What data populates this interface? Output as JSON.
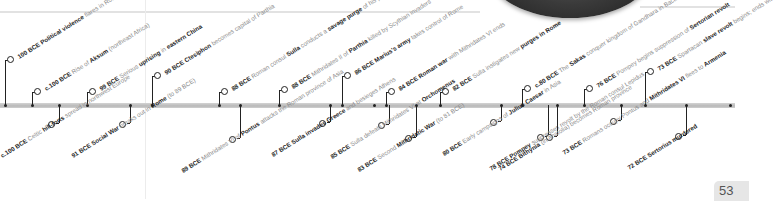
{
  "page": {
    "page_number": "53"
  },
  "timeline": {
    "above": [
      {
        "date": "100 BCE",
        "parts": [
          {
            "t": "Political violence",
            "b": true
          },
          {
            "t": " flares in Rome",
            "b": false
          }
        ],
        "x": 5,
        "ringY": 56
      },
      {
        "date": "c.100 BCE",
        "parts": [
          {
            "t": "Rise of ",
            "b": false
          },
          {
            "t": "Aksum",
            "b": true
          },
          {
            "t": " (northeast Africa)",
            "b": false
          }
        ],
        "x": 32,
        "ringY": 88
      },
      {
        "date": "99 BCE",
        "parts": [
          {
            "t": "Serious ",
            "b": false
          },
          {
            "t": "uprising",
            "b": true
          },
          {
            "t": " in ",
            "b": false
          },
          {
            "t": "eastern China",
            "b": true
          }
        ],
        "x": 87,
        "ringY": 88
      },
      {
        "date": "90 BCE",
        "parts": [
          {
            "t": "Ctesiphon",
            "b": true
          },
          {
            "t": " becomes capital of Parthia",
            "b": false
          }
        ],
        "x": 152,
        "ringY": 72
      },
      {
        "date": "88 BCE",
        "parts": [
          {
            "t": "Roman consul ",
            "b": false
          },
          {
            "t": "Sulla",
            "b": true
          },
          {
            "t": " conducts a ",
            "b": false
          },
          {
            "t": "savage purge",
            "b": true
          },
          {
            "t": " of his pro-Marian opponents",
            "b": false
          }
        ],
        "x": 219,
        "ringY": 88
      },
      {
        "date": "88 BCE",
        "parts": [
          {
            "t": "Mithridates II of ",
            "b": false
          },
          {
            "t": "Parthia",
            "b": true
          },
          {
            "t": " killed by Scythian invaders",
            "b": false
          }
        ],
        "x": 279,
        "ringY": 86
      },
      {
        "date": "86 BCE",
        "parts": [
          {
            "t": "Marius's army",
            "b": true
          },
          {
            "t": " takes control of Rome",
            "b": false
          }
        ],
        "x": 342,
        "ringY": 72
      },
      {
        "date": "84 BCE",
        "parts": [
          {
            "t": "Roman war",
            "b": true
          },
          {
            "t": " with Mithridates VI ends",
            "b": false
          }
        ],
        "x": 386,
        "ringY": 88
      },
      {
        "date": "82 BCE",
        "parts": [
          {
            "t": "Sulla instigates new ",
            "b": false
          },
          {
            "t": "purges in Rome",
            "b": true
          }
        ],
        "x": 440,
        "ringY": 88
      },
      {
        "date": "c.80 BCE",
        "parts": [
          {
            "t": "The ",
            "b": false
          },
          {
            "t": "Sakas",
            "b": true
          },
          {
            "t": " conquer kingdom of Gandhara in Bactria",
            "b": false
          }
        ],
        "x": 522,
        "ringY": 85
      },
      {
        "date": "76 BCE",
        "parts": [
          {
            "t": "Pompey begins suppression of ",
            "b": false
          },
          {
            "t": "Sertorian revolt",
            "b": true
          }
        ],
        "x": 584,
        "ringY": 85
      },
      {
        "date": "73 BCE",
        "parts": [
          {
            "t": "Spartacan ",
            "b": false
          },
          {
            "t": "slave revolt",
            "b": true
          },
          {
            "t": " begins; ends with defeat by Crassus in 71 BCE",
            "b": false
          }
        ],
        "x": 645,
        "ringY": 68
      }
    ],
    "below": [
      {
        "date": "c.100 BCE",
        "parts": [
          {
            "t": "Celtic ",
            "b": false
          },
          {
            "t": "hill-forts",
            "b": true
          },
          {
            "t": " spread in northwest Europe",
            "b": false
          }
        ],
        "x": 59,
        "ringY": 123
      },
      {
        "date": "91 BCE",
        "parts": [
          {
            "t": "Social War",
            "b": true
          },
          {
            "t": " breaks out in ",
            "b": false
          },
          {
            "t": "Rome",
            "b": true
          },
          {
            "t": " (to 89 BCE)",
            "b": false
          }
        ],
        "x": 130,
        "ringY": 123
      },
      {
        "date": "89 BCE",
        "parts": [
          {
            "t": "Mithridates VI of ",
            "b": false
          },
          {
            "t": "Pontus",
            "b": true
          },
          {
            "t": " attacks the Roman province of Asia",
            "b": false
          }
        ],
        "x": 240,
        "ringY": 138
      },
      {
        "date": "87 BCE",
        "parts": [
          {
            "t": "Sulla invades Greece",
            "b": true
          },
          {
            "t": " and besieges Athens",
            "b": false
          }
        ],
        "x": 330,
        "ringY": 122
      },
      {
        "date": "85 BCE",
        "parts": [
          {
            "t": "Sulla defeats Mithridates VI at ",
            "b": false
          },
          {
            "t": "Orchomenus",
            "b": true
          }
        ],
        "x": 389,
        "ringY": 124
      },
      {
        "date": "83 BCE",
        "parts": [
          {
            "t": "Second ",
            "b": false
          },
          {
            "t": "Mithridatic War",
            "b": true
          },
          {
            "t": " (to 81 BCE)",
            "b": false
          }
        ],
        "x": 416,
        "ringY": 137
      },
      {
        "date": "80 BCE",
        "parts": [
          {
            "t": "Early campaigns of ",
            "b": false
          },
          {
            "t": "Julius Caesar",
            "b": true
          },
          {
            "t": " in Asia",
            "b": false
          }
        ],
        "x": 501,
        "ringY": 121
      },
      {
        "date": "78 BCE",
        "parts": [
          {
            "t": "Pompey",
            "b": true
          },
          {
            "t": " suppresses revolt by the Roman consul Lepidus",
            "b": false
          }
        ],
        "x": 548,
        "ringY": 136
      },
      {
        "date": "74 BCE",
        "parts": [
          {
            "t": "Bithynia",
            "b": true
          },
          {
            "t": " (in Anatolia) becomes Roman province",
            "b": false
          }
        ],
        "x": 557,
        "ringY": 136
      },
      {
        "date": "73 BCE",
        "parts": [
          {
            "t": "Romans occupy Pontus and ",
            "b": false
          },
          {
            "t": "Mithridates VI",
            "b": true
          },
          {
            "t": " flees to ",
            "b": false
          },
          {
            "t": "Armenia",
            "b": true
          }
        ],
        "x": 621,
        "ringY": 120
      },
      {
        "date": "72 BCE",
        "parts": [
          {
            "t": "Sertorius murdered",
            "b": true
          }
        ],
        "x": 686,
        "ringY": 135
      }
    ],
    "bar_dots_x": [
      5,
      32,
      59,
      87,
      130,
      152,
      219,
      240,
      279,
      330,
      342,
      374,
      386,
      416,
      440,
      501,
      522,
      557,
      584,
      621,
      645,
      686,
      730
    ]
  }
}
